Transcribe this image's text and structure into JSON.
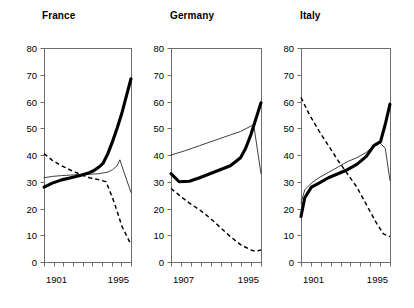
{
  "figure": {
    "width": 414,
    "height": 308,
    "background": "#ffffff"
  },
  "chart_data": {
    "type": "line",
    "title": "",
    "subtitle": "",
    "xlabel": "",
    "ylabel": "",
    "ylim": [
      0,
      80
    ],
    "yticks": [
      0,
      10,
      20,
      30,
      40,
      50,
      60,
      70,
      80
    ],
    "ytick_labels": [
      "0",
      "10",
      "20",
      "30",
      "40",
      "50",
      "60",
      "70",
      "80"
    ],
    "grid": false,
    "legend_position": "none",
    "legend_entries": [],
    "panels": [
      {
        "title": "France",
        "xlim": [
          1901,
          1995
        ],
        "xtick_labels": [
          "1901",
          "1995"
        ],
        "x_minor_tick_count": 9,
        "series": [
          {
            "name": "thick-solid",
            "style": "thick-solid",
            "x": [
              1901,
              1910,
              1920,
              1930,
              1940,
              1950,
              1955,
              1960,
              1965,
              1970,
              1975,
              1980,
              1985,
              1990,
              1995
            ],
            "values": [
              28.0,
              29.5,
              30.7,
              31.5,
              32.3,
              33.4,
              34.2,
              35.4,
              37.0,
              40.5,
              45.0,
              50.0,
              55.5,
              62.0,
              68.5
            ]
          },
          {
            "name": "thin-solid",
            "style": "thin-solid",
            "x": [
              1901,
              1910,
              1920,
              1930,
              1940,
              1950,
              1960,
              1970,
              1975,
              1980,
              1983,
              1987,
              1990,
              1995
            ],
            "values": [
              31.5,
              32.0,
              32.3,
              32.5,
              32.7,
              32.8,
              33.0,
              33.6,
              34.5,
              36.0,
              38.2,
              34.0,
              31.0,
              26.0
            ]
          },
          {
            "name": "dashed",
            "style": "dashed",
            "x": [
              1901,
              1910,
              1920,
              1930,
              1940,
              1950,
              1960,
              1968,
              1975,
              1980,
              1985,
              1990,
              1995
            ],
            "values": [
              40.5,
              38.0,
              36.0,
              34.3,
              32.8,
              31.5,
              30.8,
              30.0,
              24.0,
              19.0,
              13.5,
              10.0,
              6.5
            ]
          }
        ]
      },
      {
        "title": "Germany",
        "xlim": [
          1907,
          1995
        ],
        "xtick_labels": [
          "1907",
          "1995"
        ],
        "x_minor_tick_count": 9,
        "series": [
          {
            "name": "thick-solid",
            "style": "thick-solid",
            "x": [
              1907,
              1915,
              1925,
              1935,
              1945,
              1955,
              1965,
              1975,
              1980,
              1985,
              1990,
              1995
            ],
            "values": [
              33.0,
              30.0,
              30.2,
              31.5,
              33.0,
              34.5,
              36.0,
              39.0,
              42.5,
              47.5,
              53.5,
              59.5
            ]
          },
          {
            "name": "thin-solid",
            "style": "thin-solid",
            "x": [
              1907,
              1920,
              1935,
              1950,
              1965,
              1975,
              1985,
              1988,
              1995
            ],
            "values": [
              40.0,
              41.5,
              43.5,
              45.5,
              47.5,
              48.8,
              50.8,
              51.0,
              33.0
            ]
          },
          {
            "name": "dashed",
            "style": "dashed",
            "x": [
              1907,
              1915,
              1925,
              1935,
              1945,
              1955,
              1965,
              1975,
              1985,
              1990,
              1995
            ],
            "values": [
              27.5,
              25.0,
              22.0,
              19.5,
              16.5,
              13.0,
              9.5,
              6.5,
              4.5,
              4.0,
              4.5
            ]
          }
        ]
      },
      {
        "title": "Italy",
        "xlim": [
          1901,
          1995
        ],
        "xtick_labels": [
          "1901",
          "1995"
        ],
        "x_minor_tick_count": 9,
        "series": [
          {
            "name": "thick-solid",
            "style": "thick-solid",
            "x": [
              1901,
              1905,
              1912,
              1920,
              1930,
              1940,
              1950,
              1960,
              1970,
              1978,
              1985,
              1990,
              1995
            ],
            "values": [
              17.0,
              24.0,
              28.0,
              29.5,
              31.5,
              33.0,
              34.5,
              36.5,
              39.5,
              43.5,
              45.0,
              51.5,
              59.0
            ]
          },
          {
            "name": "thin-solid",
            "style": "thin-solid",
            "x": [
              1901,
              1905,
              1912,
              1920,
              1930,
              1940,
              1950,
              1960,
              1970,
              1978,
              1983,
              1990,
              1995
            ],
            "values": [
              22.0,
              27.0,
              29.5,
              31.5,
              33.5,
              35.5,
              37.5,
              39.0,
              41.0,
              43.5,
              45.0,
              42.5,
              30.5
            ]
          },
          {
            "name": "dashed",
            "style": "dashed",
            "x": [
              1901,
              1910,
              1920,
              1930,
              1940,
              1950,
              1960,
              1970,
              1980,
              1988,
              1995
            ],
            "values": [
              61.5,
              55.0,
              49.0,
              43.5,
              38.0,
              33.0,
              28.0,
              21.5,
              15.0,
              10.5,
              9.5
            ]
          }
        ]
      }
    ]
  }
}
